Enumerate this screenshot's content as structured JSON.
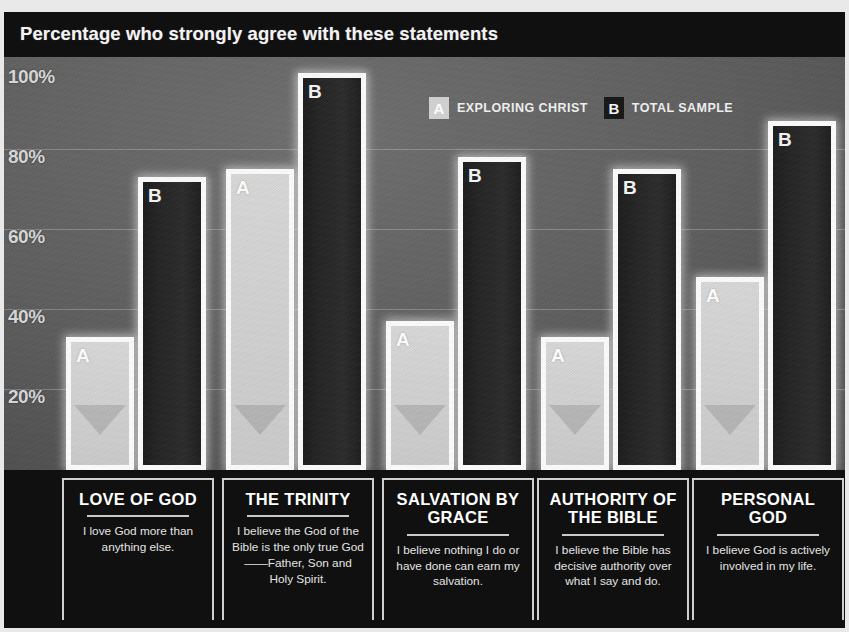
{
  "title": "Percentage who strongly agree with these statements",
  "legend": [
    {
      "key": "A",
      "label": "EXPLORING CHRIST"
    },
    {
      "key": "B",
      "label": "TOTAL SAMPLE"
    }
  ],
  "yticks": [
    "100%",
    "80%",
    "60%",
    "40%",
    "20%"
  ],
  "captions": [
    {
      "head": "LOVE OF GOD",
      "sub": "I love God more than anything else."
    },
    {
      "head": "THE TRINITY",
      "sub": "I believe the God of the Bible is the only true God——Father, Son and Holy Spirit."
    },
    {
      "head": "SALVATION BY GRACE",
      "sub": "I believe nothing I do or have done can earn my salvation."
    },
    {
      "head": "AUTHORITY OF THE BIBLE",
      "sub": "I believe the Bible has decisive authority over what I say and do."
    },
    {
      "head": "PERSONAL GOD",
      "sub": "I believe God is actively involved in my life."
    }
  ],
  "colors": {
    "background": "#121212",
    "plot": "#5d5d5d",
    "bar_a": "#d2d2d2",
    "bar_b": "#232323",
    "outline": "#fdfdfd",
    "text": "#f2f2f2"
  },
  "chart_data": {
    "type": "bar",
    "title": "Percentage who strongly agree with these statements",
    "xlabel": "",
    "ylabel": "",
    "ylim": [
      0,
      100
    ],
    "yticks": [
      20,
      40,
      60,
      80,
      100
    ],
    "ytick_labels": [
      "20%",
      "40%",
      "60%",
      "80%",
      "100%"
    ],
    "grid": true,
    "legend_position": "top-right",
    "categories": [
      "LOVE OF GOD",
      "THE TRINITY",
      "SALVATION BY GRACE",
      "AUTHORITY OF THE BIBLE",
      "PERSONAL GOD"
    ],
    "series": [
      {
        "name": "EXPLORING CHRIST",
        "key": "A",
        "values": [
          33,
          75,
          37,
          33,
          48
        ]
      },
      {
        "name": "TOTAL SAMPLE",
        "key": "B",
        "values": [
          73,
          99,
          78,
          75,
          87
        ]
      }
    ]
  }
}
